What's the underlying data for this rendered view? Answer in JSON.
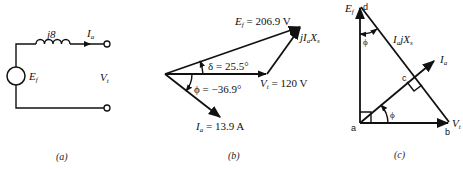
{
  "panel_a": {
    "caption": "(a)",
    "inductor_label": "j8",
    "current_label": "I",
    "current_sub": "a",
    "source_label": "E",
    "source_sub": "f",
    "terminal_label": "V",
    "terminal_sub": "t"
  },
  "panel_b": {
    "caption": "(b)",
    "ef_label": "E",
    "ef_sub": "f",
    "ef_value": " = 206.9 V",
    "delta_label": "δ = 25.5°",
    "vt_label": "V",
    "vt_sub": "t",
    "vt_value": " = 120 V",
    "phi_label": "ϕ = −36.9°",
    "ia_label": "I",
    "ia_sub": "a",
    "ia_value": " = 13.9 A",
    "drop_label_pre": "jI",
    "drop_label_sub1": "a",
    "drop_label_x": "X",
    "drop_label_sub2": "s"
  },
  "panel_c": {
    "caption": "(c)",
    "ef_label": "E",
    "ef_sub": "f",
    "point_d": "d",
    "point_a": "a",
    "point_b": "b",
    "point_c": "c",
    "drop_label_i": "I",
    "drop_label_sub1": "a",
    "drop_label_jx": "jX",
    "drop_label_sub2": "s",
    "ia_label": "I",
    "ia_sub": "a",
    "vt_label": "V",
    "vt_sub": "t",
    "phi_top": "ϕ",
    "phi_bottom": "ϕ"
  },
  "colors": {
    "ink": "#111111",
    "background": "#ffffff"
  }
}
